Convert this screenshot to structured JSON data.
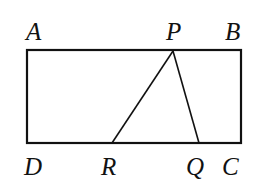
{
  "figure": {
    "type": "rectangle-with-triangle",
    "stroke_color": "#111111",
    "rectangle": {
      "corners": [
        "A",
        "B",
        "C",
        "D"
      ],
      "x1": 27,
      "y1": 50,
      "x2": 241,
      "y2": 143
    },
    "points": {
      "A": {
        "label": "A",
        "x": 27,
        "y": 50,
        "label_x": 26,
        "label_y": 40
      },
      "B": {
        "label": "B",
        "x": 241,
        "y": 50,
        "label_x": 225,
        "label_y": 40
      },
      "C": {
        "label": "C",
        "x": 241,
        "y": 143,
        "label_x": 222,
        "label_y": 175
      },
      "D": {
        "label": "D",
        "x": 27,
        "y": 143,
        "label_x": 24,
        "label_y": 175
      },
      "P": {
        "label": "P",
        "x": 173,
        "y": 51,
        "label_x": 166,
        "label_y": 40
      },
      "R": {
        "label": "R",
        "x": 112,
        "y": 143,
        "label_x": 101,
        "label_y": 175
      },
      "Q": {
        "label": "Q",
        "x": 199,
        "y": 143,
        "label_x": 186,
        "label_y": 175
      }
    },
    "segments": [
      [
        "P",
        "R"
      ],
      [
        "P",
        "Q"
      ]
    ]
  }
}
